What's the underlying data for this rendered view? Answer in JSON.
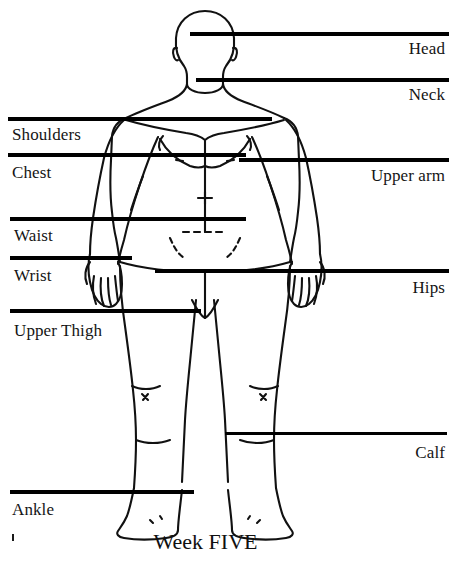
{
  "diagram": {
    "caption": "Week FIVE",
    "background_color": "#ffffff",
    "line_color": "#000000",
    "text_color": "#151515",
    "measurement_lines": [
      {
        "id": "head",
        "label": "Head",
        "side": "right",
        "y": 34,
        "x_start": 190,
        "x_end": 449
      },
      {
        "id": "neck",
        "label": "Neck",
        "side": "right",
        "y": 80,
        "x_start": 196,
        "x_end": 449
      },
      {
        "id": "shoulders",
        "label": "Shoulders",
        "side": "left",
        "y": 119,
        "x_start": 8,
        "x_end": 272
      },
      {
        "id": "chest",
        "label": "Chest",
        "side": "left",
        "y": 155,
        "x_start": 8,
        "x_end": 246
      },
      {
        "id": "upper_arm",
        "label": "Upper arm",
        "side": "right",
        "y": 160,
        "x_start": 239,
        "x_end": 449
      },
      {
        "id": "waist",
        "label": "Waist",
        "side": "left",
        "y": 219,
        "x_start": 10,
        "x_end": 246
      },
      {
        "id": "wrist",
        "label": "Wrist",
        "side": "left",
        "y": 258,
        "x_start": 10,
        "x_end": 132
      },
      {
        "id": "hips",
        "label": "Hips",
        "side": "right",
        "y": 271,
        "x_start": 155,
        "x_end": 449
      },
      {
        "id": "upper_thigh",
        "label": "Upper Thigh",
        "side": "left",
        "y": 311,
        "x_start": 10,
        "x_end": 201
      },
      {
        "id": "calf",
        "label": "Calf",
        "side": "right",
        "y": 434,
        "x_start": 225,
        "x_end": 447
      },
      {
        "id": "ankle",
        "label": "Ankle",
        "side": "left",
        "y": 492,
        "x_start": 10,
        "x_end": 194
      }
    ],
    "label_positions": [
      {
        "id": "head",
        "x": 396,
        "y": 41
      },
      {
        "id": "neck",
        "x": 396,
        "y": 87
      },
      {
        "id": "shoulders",
        "x": 12,
        "y": 127
      },
      {
        "id": "chest",
        "x": 12,
        "y": 165
      },
      {
        "id": "upper_arm",
        "x": 361,
        "y": 168
      },
      {
        "id": "waist",
        "x": 14,
        "y": 228
      },
      {
        "id": "wrist",
        "x": 14,
        "y": 268
      },
      {
        "id": "hips",
        "x": 409,
        "y": 280
      },
      {
        "id": "upper_thigh",
        "x": 14,
        "y": 323
      },
      {
        "id": "calf",
        "x": 398,
        "y": 445
      },
      {
        "id": "ankle",
        "x": 12,
        "y": 502
      }
    ],
    "caption_position": {
      "x": 205,
      "y": 539
    },
    "stray_mark": {
      "x": 12,
      "y": 534
    }
  }
}
